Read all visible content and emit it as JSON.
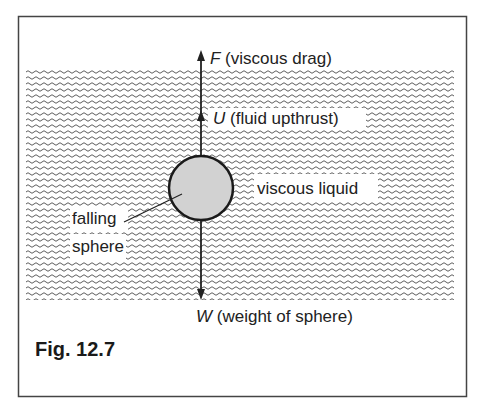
{
  "figure": {
    "caption": "Fig. 12.7",
    "labels": {
      "drag_symbol": "F",
      "drag_text": " (viscous drag)",
      "upthrust_symbol": "U",
      "upthrust_text": " (fluid upthrust)",
      "weight_symbol": "W",
      "weight_text": " (weight of sphere)",
      "liquid": "viscous liquid",
      "sphere_line1": "falling",
      "sphere_line2": "sphere"
    },
    "forces": [
      {
        "symbol": "F",
        "name": "viscous drag",
        "direction": "up"
      },
      {
        "symbol": "U",
        "name": "fluid upthrust",
        "direction": "up"
      },
      {
        "symbol": "W",
        "name": "weight of sphere",
        "direction": "down"
      }
    ],
    "colors": {
      "border": "#444444",
      "sphere_fill": "#d2d2d2",
      "ink": "#222222",
      "background": "#ffffff"
    }
  }
}
